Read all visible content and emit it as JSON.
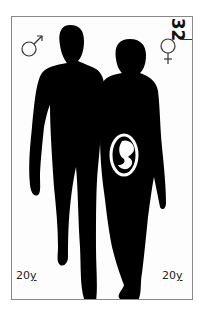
{
  "card": {
    "number": "32",
    "left_symbol": "male-symbol",
    "right_symbol": "female-symbol",
    "left_age_num": "20",
    "left_age_unit": "y",
    "right_age_num": "20",
    "right_age_unit": "y",
    "colors": {
      "silhouette": "#000000",
      "background": "#fdfdfd",
      "border": "#888888"
    }
  }
}
